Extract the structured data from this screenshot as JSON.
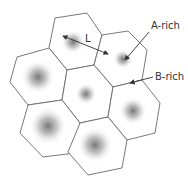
{
  "labels": {
    "distance": "L",
    "a_rich": "A-rich",
    "b_rich": "B-rich"
  },
  "colors": {
    "stroke": "#6a6a6a",
    "core": "#707070",
    "text": "#333333"
  },
  "cells": [
    {
      "id": "top",
      "points": "55,18 87,13 102,35 94,65 67,70 49,48",
      "core": [
        73,
        42
      ],
      "r": 12
    },
    {
      "id": "top-right",
      "points": "102,35 128,31 147,50 142,80 113,87 94,65",
      "core": [
        123,
        59
      ],
      "r": 10
    },
    {
      "id": "left",
      "points": "17,57 49,48 67,70 62,100 28,105 10,82",
      "core": [
        38,
        77
      ],
      "r": 17
    },
    {
      "id": "center",
      "points": "67,70 94,65 113,87 108,117 80,123 62,100",
      "core": [
        86,
        94
      ],
      "r": 11
    },
    {
      "id": "right",
      "points": "113,87 142,80 160,103 155,133 127,140 108,117",
      "core": [
        133,
        111
      ],
      "r": 14
    },
    {
      "id": "bottom-left",
      "points": "28,105 62,100 80,123 75,153 43,157 20,133",
      "core": [
        48,
        126
      ],
      "r": 19
    },
    {
      "id": "bottom",
      "points": "80,123 108,117 127,140 122,168 88,175 68,152",
      "core": [
        95,
        145
      ],
      "r": 18
    }
  ]
}
